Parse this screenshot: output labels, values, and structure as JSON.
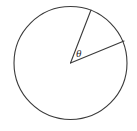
{
  "figure": {
    "background_color": "#ffffff",
    "stroke_color": "#3a3a3a",
    "label_color": "#2e2e2e",
    "angle_label": "θ",
    "angle_symbol_name": "theta"
  },
  "chart_data": {
    "type": "diagram",
    "shapes": [
      {
        "name": "circle",
        "kind": "circle",
        "cx": 70.5,
        "cy": 63.0,
        "r": 56.5,
        "stroke": "#3a3a3a",
        "stroke_width": 1.1,
        "fill": "none"
      },
      {
        "name": "radius-upper",
        "kind": "line",
        "x1": 70.5,
        "y1": 63.0,
        "x2": 91.0,
        "y2": 10.0,
        "angle_deg": 68.9,
        "stroke": "#3a3a3a",
        "stroke_width": 1.1
      },
      {
        "name": "radius-right",
        "kind": "line",
        "x1": 70.5,
        "y1": 63.0,
        "x2": 124.0,
        "y2": 41.0,
        "angle_deg": 22.3,
        "stroke": "#3a3a3a",
        "stroke_width": 1.1
      }
    ],
    "annotations": [
      {
        "name": "theta-label",
        "text": "θ",
        "x": 77.0,
        "y": 49.0,
        "font_size": 11,
        "font_style": "italic",
        "color": "#2e2e2e"
      }
    ],
    "measured_angle_deg": 46.6,
    "xlim": [
      0,
      137
    ],
    "ylim": [
      0,
      131
    ],
    "grid": false,
    "legend": null,
    "xlabel": "",
    "ylabel": ""
  }
}
